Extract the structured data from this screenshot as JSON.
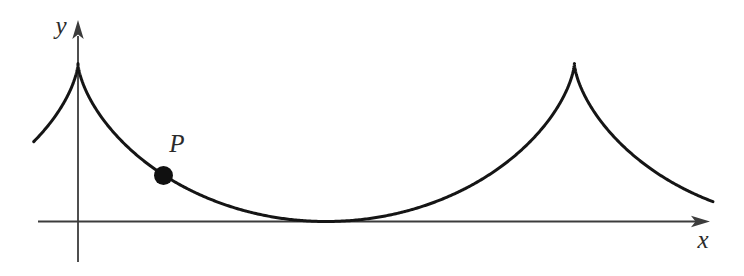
{
  "figure": {
    "width": 744,
    "height": 276,
    "background": "#ffffff",
    "labels": {
      "y_axis": "y",
      "x_axis": "x",
      "point": "P"
    },
    "colors": {
      "curve": "#151515",
      "axis": "#3c3c3c",
      "point_fill": "#101010",
      "text": "#2b2b2b"
    },
    "axes": {
      "x_axis": {
        "x_start": 38,
        "x_line_end": 696,
        "tip_x": 710,
        "y": 221.5
      },
      "y_axis": {
        "y_bottom": 262,
        "y_line_end": 36,
        "tip_y": 20,
        "x": 78
      },
      "arrow_length": 19,
      "arrow_half_width": 5.7,
      "stroke_width": 1.8
    },
    "chart_data": {
      "type": "line",
      "curve": "cycloid (inverted arches, cusps pointing up, tangent to x-axis at minima)",
      "parametric_x": "cusp_x + a*(t - sin(t))",
      "parametric_y": "axis_y - a*(1 + cos(t))",
      "a": 79,
      "cusp_x": 78,
      "axis_y": 221.5,
      "t_range": [
        -1.56,
        8.7
      ],
      "t_step": 0.01,
      "cusp_points": [
        [
          78,
          63.5
        ],
        [
          574.3,
          63.5
        ]
      ],
      "tangent_point": [
        326.2,
        221.5
      ],
      "curve_end_points": [
        [
          34,
          142
        ],
        [
          712,
          202
        ]
      ],
      "stroke_width": 3
    },
    "point_P": {
      "cx": 163.5,
      "cy": 175.5,
      "r": 9.5,
      "label_x": 177,
      "label_y": 152,
      "font_size": 25
    },
    "label_positions": {
      "y": {
        "x": 61,
        "y": 34,
        "font_size": 25
      },
      "x": {
        "x": 703,
        "y": 248,
        "font_size": 25
      }
    }
  }
}
